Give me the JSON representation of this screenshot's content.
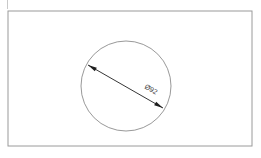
{
  "document": {
    "type": "engineering-drawing",
    "background_color": "#ffffff"
  },
  "frame": {
    "name": "drawing-border",
    "stroke_color": "#9a9a9a",
    "fill_color": "#ffffff",
    "x": 8,
    "y": 11,
    "width": 244,
    "height": 135
  },
  "artifacts": {
    "top_left_mark_color": "#c9c9c9"
  },
  "circle": {
    "name": "circle-outline",
    "stroke_color": "#8d8d8d",
    "center_x": 126,
    "center_y": 86,
    "radius": 45
  },
  "dimension": {
    "label": "Ø92",
    "label_x": 148,
    "label_y": 90,
    "label_rotation": 30,
    "text_color": "#3a3a3a",
    "line_color": "#1f1f1f",
    "start_x": 88,
    "start_y": 65,
    "end_x": 163,
    "end_y": 108
  }
}
